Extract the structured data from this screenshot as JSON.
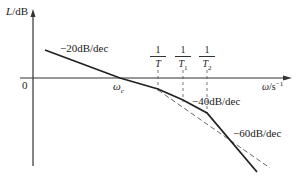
{
  "diagram": {
    "type": "bode-magnitude-asymptote",
    "y_axis_label": {
      "var": "L",
      "unit": "/dB"
    },
    "x_axis_label": {
      "var": "ω",
      "unit": "/s",
      "exp": "−1"
    },
    "origin_label": "0",
    "crossover_label": {
      "var": "ω",
      "sub": "c"
    },
    "break_frequencies": [
      {
        "num": "1",
        "den": "T",
        "sub": ""
      },
      {
        "num": "1",
        "den": "T",
        "sub": "1"
      },
      {
        "num": "1",
        "den": "T",
        "sub": "2"
      }
    ],
    "slope_labels": [
      "−20dB/dec",
      "−40dB/dec",
      "−60dB/dec"
    ],
    "colors": {
      "line": "#222222",
      "axis": "#333333",
      "dashed": "#555555"
    }
  }
}
